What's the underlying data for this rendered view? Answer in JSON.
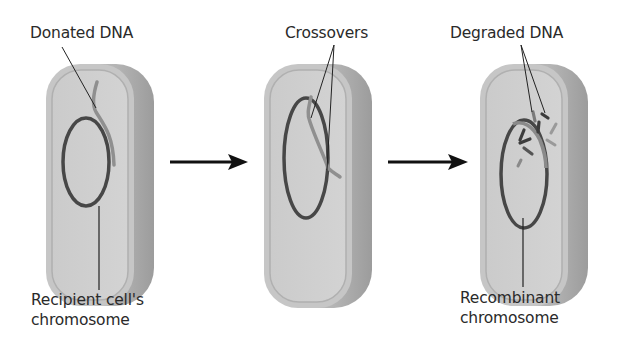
{
  "diagram": {
    "panels": [
      {
        "id": "panel-1",
        "top_label": "Donated DNA",
        "bottom_label_line1": "Recipient cell's",
        "bottom_label_line2": "chromosome"
      },
      {
        "id": "panel-2",
        "top_label": "Crossovers"
      },
      {
        "id": "panel-3",
        "top_label": "Degraded DNA",
        "bottom_label_line1": "Recombinant",
        "bottom_label_line2": "chromosome"
      }
    ],
    "arrows": [
      "arrow-1-to-2",
      "arrow-2-to-3"
    ],
    "colors": {
      "cell_fill": "#c9c9c9",
      "cell_inner": "#d6d6d6",
      "cell_shadow": "#a9a9a9",
      "chromosome": "#4a4a4a",
      "donor_dna": "#8f8f8f",
      "arrow": "#111111",
      "text": "#2a2a2a"
    }
  }
}
